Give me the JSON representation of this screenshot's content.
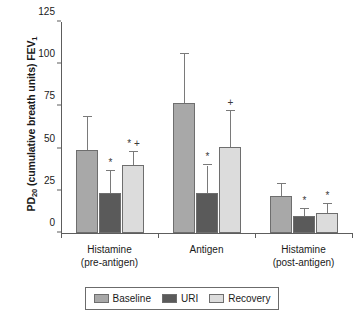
{
  "chart_data": {
    "type": "bar",
    "title": "",
    "xlabel": "",
    "ylabel": "PD20 (cumulative breath units) FEV1",
    "ylabel_parts": {
      "prefix": "PD",
      "sub1": "20",
      "mid": " (cumulative breath units) FEV",
      "sub2": "1"
    },
    "ylim": [
      0,
      125
    ],
    "yticks": [
      0,
      25,
      50,
      75,
      100,
      125
    ],
    "ytick_labels": [
      "0",
      "25",
      "50",
      "75",
      "100",
      "125"
    ],
    "grid": false,
    "legend_position": "bottom",
    "categories": [
      {
        "line1": "Histamine",
        "line2": "(pre-antigen)"
      },
      {
        "line1": "Antigen",
        "line2": ""
      },
      {
        "line1": "Histamine",
        "line2": "(post-antigen)"
      }
    ],
    "series": [
      {
        "name": "Baseline",
        "color": "#a8a8a8",
        "values": [
          49,
          77,
          22
        ],
        "err_upper": [
          69,
          106,
          29
        ],
        "markers": [
          "",
          "",
          ""
        ]
      },
      {
        "name": "URI",
        "color": "#5a5a5a",
        "values": [
          24,
          24,
          10
        ],
        "err_upper": [
          37,
          40,
          14
        ],
        "markers": [
          "*",
          "*",
          "*"
        ]
      },
      {
        "name": "Recovery",
        "color": "#dcdcdc",
        "values": [
          40,
          51,
          12
        ],
        "err_upper": [
          48,
          72,
          17
        ],
        "markers": [
          "* +",
          "+",
          "*"
        ]
      }
    ],
    "annotations": {
      "asterisk": "*",
      "plus": "+"
    }
  }
}
